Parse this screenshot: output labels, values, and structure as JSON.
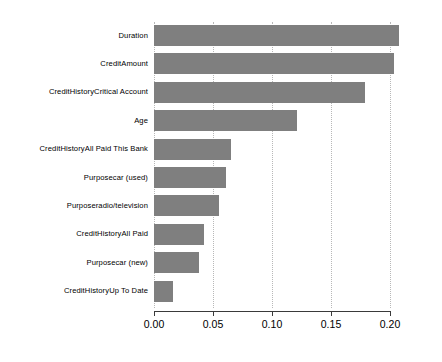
{
  "chart_data": {
    "type": "bar",
    "orientation": "horizontal",
    "title": "",
    "subtitle": "",
    "xlabel": "",
    "ylabel": "",
    "xlim": [
      0.0,
      0.2077
    ],
    "grid": true,
    "grid_axis": "x",
    "legend": null,
    "bar_color": "#7f7f7f",
    "axis_color": "#3a3a3a",
    "gridline_color": "#b8b8b8",
    "xticks": [
      0.0,
      0.05,
      0.1,
      0.15,
      0.2
    ],
    "xtick_labels": [
      "0.00",
      "0.05",
      "0.10",
      "0.15",
      "0.20"
    ],
    "categories": [
      "Duration",
      "CreditAmount",
      "CreditHistoryCritical Account",
      "Age",
      "CreditHistoryAll Paid This Bank",
      "Purposecar (used)",
      "Purposeradio/television",
      "CreditHistoryAll Paid",
      "Purposecar (new)",
      "CreditHistoryUp To Date"
    ],
    "values": [
      0.208,
      0.203,
      0.179,
      0.121,
      0.065,
      0.061,
      0.055,
      0.042,
      0.038,
      0.016
    ]
  }
}
